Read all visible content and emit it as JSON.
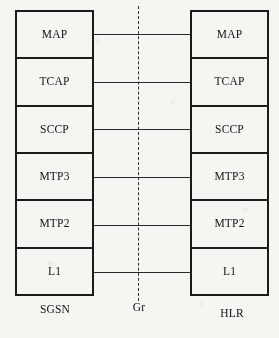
{
  "diagram": {
    "type": "protocol-stack",
    "colors": {
      "background": "#f6f5f2",
      "stroke": "#1b1b1b",
      "connector": "#2a2a2a",
      "text": "#121212"
    },
    "left_stack": {
      "caption": "SGSN",
      "layers": [
        {
          "label": "MAP"
        },
        {
          "label": "TCAP"
        },
        {
          "label": "SCCP"
        },
        {
          "label": "MTP3"
        },
        {
          "label": "MTP2"
        },
        {
          "label": "L1"
        }
      ]
    },
    "right_stack": {
      "caption": "HLR",
      "layers": [
        {
          "label": "MAP"
        },
        {
          "label": "TCAP"
        },
        {
          "label": "SCCP"
        },
        {
          "label": "MTP3"
        },
        {
          "label": "MTP2"
        },
        {
          "label": "L1"
        }
      ]
    },
    "interface": {
      "caption": "Gr",
      "style": "dashed-vertical"
    },
    "peer_connections": [
      {
        "layer": "MAP"
      },
      {
        "layer": "TCAP"
      },
      {
        "layer": "SCCP"
      },
      {
        "layer": "MTP3"
      },
      {
        "layer": "MTP2"
      },
      {
        "layer": "L1"
      }
    ]
  }
}
